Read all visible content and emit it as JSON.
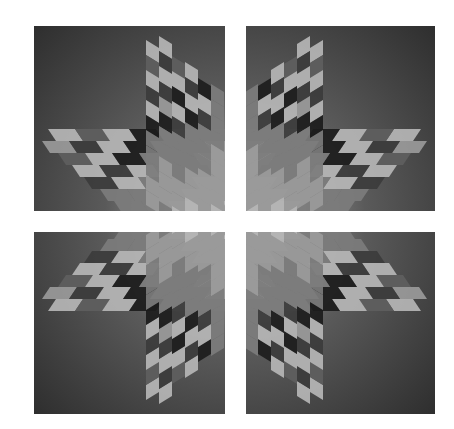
{
  "canvas": {
    "width": 454,
    "height": 429,
    "background": "#ffffff"
  },
  "gradient": {
    "outer": "#2e2e2e",
    "mid": "#5a5a5a",
    "inner": "#b4b4b4"
  },
  "palette": [
    "#1c1c1c",
    "#3c3c3c",
    "#5e5e5e",
    "#7c7c7c",
    "#9a9a9a",
    "#b6b6b6",
    "#c8c8c8"
  ],
  "quadrants": [
    {
      "name": "top-left",
      "x": 34,
      "y": 26,
      "w": 191,
      "h": 185,
      "flipX": false,
      "flipY": false
    },
    {
      "name": "top-right",
      "x": 246,
      "y": 26,
      "w": 189,
      "h": 185,
      "flipX": true,
      "flipY": false
    },
    {
      "name": "bottom-left",
      "x": 34,
      "y": 232,
      "w": 191,
      "h": 182,
      "flipX": false,
      "flipY": true
    },
    {
      "name": "bottom-right",
      "x": 246,
      "y": 232,
      "w": 189,
      "h": 182,
      "flipX": true,
      "flipY": true
    }
  ],
  "vertical_arm": {
    "x0": 112,
    "col_w": 13,
    "cell_h": 15,
    "slant": 8,
    "col_top": [
      14,
      10,
      30,
      36,
      52,
      58
    ],
    "shades": [
      [
        5,
        2,
        5,
        1,
        5,
        0,
        3,
        3,
        3,
        4,
        4
      ],
      [
        5,
        1,
        5,
        1,
        4,
        0,
        3,
        3,
        4,
        4,
        4
      ],
      [
        2,
        5,
        0,
        5,
        1,
        3,
        3,
        3,
        4,
        4,
        5
      ],
      [
        5,
        1,
        5,
        0,
        3,
        3,
        3,
        4,
        4,
        5,
        5
      ],
      [
        0,
        5,
        1,
        3,
        3,
        3,
        4,
        4,
        4,
        5,
        5
      ],
      [
        3,
        3,
        3,
        3,
        4,
        4,
        4,
        4,
        5,
        5,
        5
      ]
    ]
  },
  "horizontal_arm": {
    "y0": 103,
    "row_h": 12,
    "cell_w": 27,
    "slant": 8,
    "row_left": [
      14,
      8,
      24,
      38,
      50,
      66,
      80
    ],
    "shades": [
      [
        5,
        2,
        5,
        0,
        3,
        3,
        3
      ],
      [
        4,
        1,
        5,
        0,
        3,
        3,
        4
      ],
      [
        2,
        5,
        0,
        3,
        3,
        4,
        4
      ],
      [
        5,
        1,
        5,
        3,
        3,
        4,
        5
      ],
      [
        1,
        5,
        3,
        3,
        4,
        4,
        5
      ],
      [
        3,
        3,
        3,
        4,
        4,
        5,
        5
      ],
      [
        3,
        3,
        4,
        4,
        5,
        5,
        6
      ]
    ]
  }
}
